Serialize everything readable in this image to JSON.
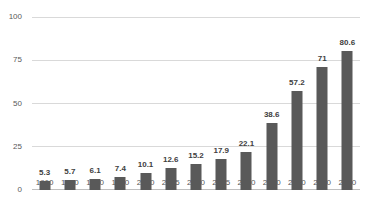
{
  "chart_data": {
    "type": "bar",
    "title": "",
    "xlabel": "",
    "ylabel": "",
    "categories": [
      "1960",
      "1970",
      "1980",
      "1990",
      "2000",
      "2005",
      "2010",
      "2015",
      "2020",
      "2030",
      "2040",
      "2050",
      "2060"
    ],
    "values": [
      5.3,
      5.7,
      6.1,
      7.4,
      10.1,
      12.6,
      15.2,
      17.9,
      22.1,
      38.6,
      57.2,
      71,
      80.6
    ],
    "data_labels": [
      "5.3",
      "5.7",
      "6.1",
      "7.4",
      "10.1",
      "12.6",
      "15.2",
      "17.9",
      "22.1",
      "38.6",
      "57.2",
      "71",
      "80.6"
    ],
    "ylim": [
      0,
      100
    ],
    "yticks": [
      "0",
      "25",
      "50",
      "75",
      "100"
    ],
    "grid": true,
    "legend": false,
    "colors": {
      "bar": "#595959",
      "gridline": "#d9d9d9",
      "axis_line": "#bfbfbf",
      "tick_label": "#595959",
      "data_label": "#404040",
      "background": "#ffffff"
    }
  }
}
